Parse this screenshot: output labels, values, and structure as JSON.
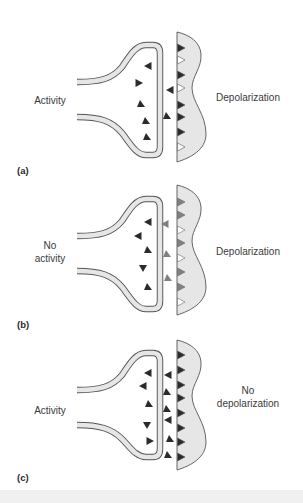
{
  "figure": {
    "colors": {
      "membrane_fill": "#e6e6e6",
      "membrane_stroke": "#555555",
      "postsynaptic_fill": "#e6e6e6",
      "transmitter_dark": "#2b2b2b",
      "transmitter_gray": "#808080",
      "receptor_open": "#ffffff"
    },
    "panels": [
      {
        "id": "a",
        "label": "(a)",
        "presynaptic_label": [
          "Activity"
        ],
        "postsynaptic_label": [
          "Depolarization"
        ],
        "receptors": [
          "filled-dark",
          "open",
          "filled-dark",
          "open",
          "filled-dark",
          "filled-dark",
          "filled-dark",
          "open"
        ],
        "vesicle_count": 5,
        "cleft_transmitters": 2,
        "cleft_color": "dark"
      },
      {
        "id": "b",
        "label": "(b)",
        "presynaptic_label": [
          "No",
          "activity"
        ],
        "postsynaptic_label": [
          "Depolarization"
        ],
        "receptors": [
          "filled-gray",
          "filled-gray",
          "open",
          "filled-gray",
          "open",
          "filled-gray",
          "filled-gray",
          "open"
        ],
        "vesicle_count": 5,
        "cleft_transmitters": 3,
        "cleft_color": "gray"
      },
      {
        "id": "c",
        "label": "(c)",
        "presynaptic_label": [
          "Activity"
        ],
        "postsynaptic_label": [
          "No",
          "depolarization"
        ],
        "receptors": [
          "filled-dark",
          "filled-dark",
          "filled-dark",
          "filled-dark",
          "filled-dark",
          "filled-dark",
          "filled-dark",
          "filled-dark"
        ],
        "vesicle_count": 5,
        "cleft_transmitters": 6,
        "cleft_color": "dark"
      }
    ]
  }
}
